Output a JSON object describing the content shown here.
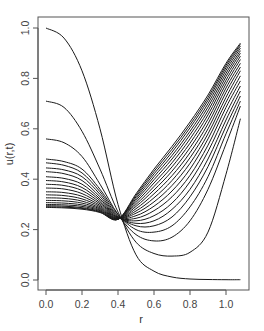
{
  "chart_data": {
    "type": "line",
    "title": "",
    "xlabel": "r",
    "ylabel": "u(r,t)",
    "xlim": [
      0.0,
      1.08
    ],
    "ylim": [
      0.0,
      1.0
    ],
    "xticks": [
      "0.0",
      "0.2",
      "0.4",
      "0.6",
      "0.8",
      "1.0"
    ],
    "yticks": [
      "0.0",
      "0.2",
      "0.4",
      "0.6",
      "0.8",
      "1.0"
    ],
    "grid": false,
    "legend": null,
    "x": [
      0.0,
      0.1,
      0.2,
      0.3,
      0.4,
      0.5,
      0.6,
      0.7,
      0.8,
      0.9,
      1.0,
      1.08
    ],
    "series": [
      {
        "name": "t0",
        "values": [
          1.0,
          0.96,
          0.83,
          0.6,
          0.3,
          0.1,
          0.035,
          0.012,
          0.004,
          0.002,
          0.001,
          0.001
        ]
      },
      {
        "name": "t1",
        "values": [
          0.71,
          0.685,
          0.59,
          0.44,
          0.27,
          0.15,
          0.105,
          0.095,
          0.11,
          0.19,
          0.42,
          0.64
        ]
      },
      {
        "name": "t2",
        "values": [
          0.56,
          0.545,
          0.49,
          0.38,
          0.26,
          0.18,
          0.155,
          0.17,
          0.235,
          0.36,
          0.54,
          0.69
        ]
      },
      {
        "name": "t3",
        "values": [
          0.48,
          0.47,
          0.44,
          0.36,
          0.26,
          0.2,
          0.19,
          0.215,
          0.29,
          0.41,
          0.58,
          0.71
        ]
      },
      {
        "name": "t4",
        "values": [
          0.465,
          0.455,
          0.425,
          0.35,
          0.255,
          0.215,
          0.215,
          0.25,
          0.33,
          0.45,
          0.61,
          0.73
        ]
      },
      {
        "name": "t5",
        "values": [
          0.445,
          0.437,
          0.41,
          0.34,
          0.252,
          0.225,
          0.235,
          0.28,
          0.36,
          0.48,
          0.635,
          0.75
        ]
      },
      {
        "name": "t6",
        "values": [
          0.43,
          0.422,
          0.395,
          0.33,
          0.25,
          0.235,
          0.255,
          0.305,
          0.39,
          0.51,
          0.66,
          0.77
        ]
      },
      {
        "name": "t7",
        "values": [
          0.41,
          0.403,
          0.38,
          0.322,
          0.248,
          0.245,
          0.275,
          0.33,
          0.415,
          0.535,
          0.685,
          0.79
        ]
      },
      {
        "name": "t8",
        "values": [
          0.395,
          0.389,
          0.367,
          0.315,
          0.247,
          0.255,
          0.293,
          0.353,
          0.44,
          0.56,
          0.705,
          0.81
        ]
      },
      {
        "name": "t9",
        "values": [
          0.38,
          0.375,
          0.355,
          0.308,
          0.246,
          0.265,
          0.31,
          0.375,
          0.463,
          0.58,
          0.725,
          0.83
        ]
      },
      {
        "name": "t10",
        "values": [
          0.365,
          0.361,
          0.343,
          0.302,
          0.245,
          0.274,
          0.326,
          0.395,
          0.485,
          0.6,
          0.745,
          0.845
        ]
      },
      {
        "name": "t11",
        "values": [
          0.35,
          0.347,
          0.332,
          0.296,
          0.244,
          0.283,
          0.342,
          0.414,
          0.505,
          0.62,
          0.762,
          0.86
        ]
      },
      {
        "name": "t12",
        "values": [
          0.338,
          0.335,
          0.322,
          0.291,
          0.243,
          0.292,
          0.357,
          0.432,
          0.525,
          0.638,
          0.778,
          0.875
        ]
      },
      {
        "name": "t13",
        "values": [
          0.326,
          0.324,
          0.313,
          0.286,
          0.243,
          0.3,
          0.371,
          0.449,
          0.543,
          0.655,
          0.793,
          0.888
        ]
      },
      {
        "name": "t14",
        "values": [
          0.316,
          0.314,
          0.305,
          0.282,
          0.242,
          0.308,
          0.385,
          0.465,
          0.56,
          0.671,
          0.807,
          0.9
        ]
      },
      {
        "name": "t15",
        "values": [
          0.307,
          0.305,
          0.298,
          0.278,
          0.242,
          0.316,
          0.398,
          0.48,
          0.576,
          0.686,
          0.82,
          0.91
        ]
      },
      {
        "name": "t16",
        "values": [
          0.3,
          0.298,
          0.292,
          0.275,
          0.241,
          0.323,
          0.41,
          0.494,
          0.59,
          0.7,
          0.832,
          0.92
        ]
      },
      {
        "name": "t17",
        "values": [
          0.295,
          0.293,
          0.287,
          0.272,
          0.241,
          0.33,
          0.421,
          0.507,
          0.604,
          0.713,
          0.843,
          0.928
        ]
      },
      {
        "name": "t18",
        "values": [
          0.291,
          0.289,
          0.284,
          0.27,
          0.241,
          0.336,
          0.431,
          0.519,
          0.616,
          0.724,
          0.852,
          0.935
        ]
      },
      {
        "name": "t19",
        "values": [
          0.288,
          0.286,
          0.281,
          0.268,
          0.241,
          0.342,
          0.44,
          0.53,
          0.627,
          0.734,
          0.86,
          0.94
        ]
      }
    ]
  }
}
